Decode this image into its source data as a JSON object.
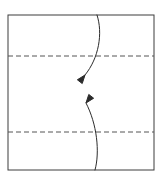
{
  "figure": {
    "title": "",
    "type": "origami-fold-diagram",
    "background_color": "#ffffff",
    "canvas": {
      "width": 163,
      "height": 186
    }
  },
  "paper": {
    "label": "square paper outline",
    "shape": "square",
    "stroke_color": "#3c3c3c",
    "stroke_width": 1,
    "fill_color": "#ffffff",
    "left": 8,
    "top": 15,
    "right": 154,
    "bottom": 170
  },
  "crease_lines": [
    {
      "label": "upper crease line",
      "style": "dashed",
      "stroke_color": "#555555",
      "stroke_width": 1,
      "dash_pattern": "5,3",
      "x1": 8,
      "y1": 56,
      "x2": 154,
      "y2": 56
    },
    {
      "label": "lower crease line",
      "style": "dashed",
      "stroke_color": "#555555",
      "stroke_width": 1,
      "dash_pattern": "5,3",
      "x1": 8,
      "y1": 132,
      "x2": 154,
      "y2": 132
    }
  ],
  "arrows": [
    {
      "label": "fold top edge down arrow",
      "direction": "down",
      "stroke_color": "#2b2b2b",
      "stroke_width": 1,
      "start": {
        "x": 97,
        "y": 15
      },
      "end": {
        "x": 85,
        "y": 75
      },
      "control1": {
        "x": 103,
        "y": 33
      },
      "control2": {
        "x": 99,
        "y": 58
      },
      "head": {
        "x": 85,
        "y": 75,
        "angle_deg": 232,
        "length": 9,
        "spread_deg": 20
      }
    },
    {
      "label": "fold bottom edge up arrow",
      "direction": "up",
      "stroke_color": "#2b2b2b",
      "stroke_width": 1,
      "start": {
        "x": 95,
        "y": 170
      },
      "end": {
        "x": 86,
        "y": 103
      },
      "control1": {
        "x": 100,
        "y": 152
      },
      "control2": {
        "x": 97,
        "y": 124
      },
      "head": {
        "x": 86,
        "y": 103,
        "angle_deg": 52,
        "length": 9,
        "spread_deg": 20
      }
    }
  ]
}
